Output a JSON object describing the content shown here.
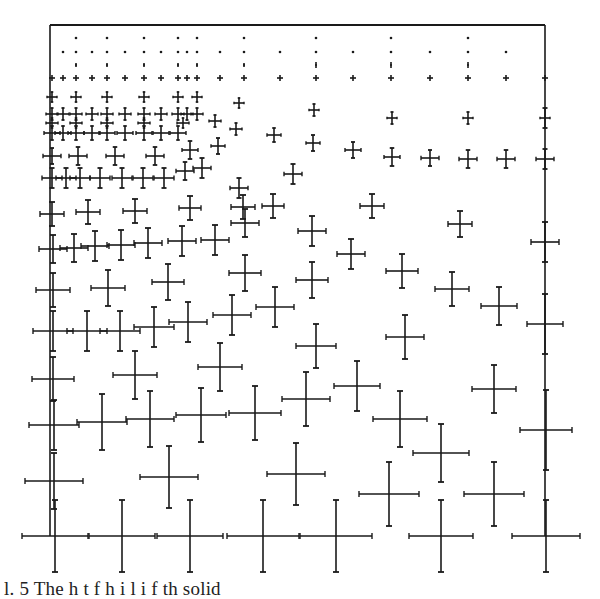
{
  "figure": {
    "frame": {
      "left": 50,
      "top": 25,
      "right": 545,
      "bottom": 536
    },
    "ink": "#1a1a1a",
    "caption": "l. 5   The   h    t             f       h       i    l    i    f  th   solid"
  },
  "chart_data": {
    "type": "scatter",
    "title": "",
    "xlabel": "",
    "ylabel": "",
    "grid": false,
    "legend": null,
    "points": [
      {
        "x": 76,
        "y": 38,
        "dx": 0,
        "dy": 0
      },
      {
        "x": 107,
        "y": 38,
        "dx": 0,
        "dy": 0
      },
      {
        "x": 144,
        "y": 38,
        "dx": 0,
        "dy": 0
      },
      {
        "x": 178,
        "y": 38,
        "dx": 0,
        "dy": 0
      },
      {
        "x": 197,
        "y": 38,
        "dx": 0,
        "dy": 0
      },
      {
        "x": 244,
        "y": 38,
        "dx": 0,
        "dy": 0
      },
      {
        "x": 316,
        "y": 38,
        "dx": 0,
        "dy": 0
      },
      {
        "x": 391,
        "y": 38,
        "dx": 0,
        "dy": 0
      },
      {
        "x": 468,
        "y": 38,
        "dx": 0,
        "dy": 0
      },
      {
        "x": 63,
        "y": 52,
        "dx": 0,
        "dy": 0
      },
      {
        "x": 76,
        "y": 52,
        "dx": 0,
        "dy": 0
      },
      {
        "x": 92,
        "y": 52,
        "dx": 0,
        "dy": 0
      },
      {
        "x": 107,
        "y": 52,
        "dx": 0,
        "dy": 0
      },
      {
        "x": 125,
        "y": 52,
        "dx": 0,
        "dy": 0
      },
      {
        "x": 144,
        "y": 52,
        "dx": 0,
        "dy": 0
      },
      {
        "x": 161,
        "y": 52,
        "dx": 0,
        "dy": 0
      },
      {
        "x": 178,
        "y": 52,
        "dx": 0,
        "dy": 0
      },
      {
        "x": 187,
        "y": 52,
        "dx": 0,
        "dy": 0
      },
      {
        "x": 197,
        "y": 52,
        "dx": 0,
        "dy": 0
      },
      {
        "x": 220,
        "y": 52,
        "dx": 0,
        "dy": 0
      },
      {
        "x": 244,
        "y": 52,
        "dx": 0,
        "dy": 0
      },
      {
        "x": 280,
        "y": 52,
        "dx": 0,
        "dy": 0
      },
      {
        "x": 316,
        "y": 52,
        "dx": 0,
        "dy": 0
      },
      {
        "x": 353,
        "y": 52,
        "dx": 0,
        "dy": 0
      },
      {
        "x": 391,
        "y": 52,
        "dx": 0,
        "dy": 0
      },
      {
        "x": 430,
        "y": 52,
        "dx": 0,
        "dy": 0
      },
      {
        "x": 468,
        "y": 52,
        "dx": 0,
        "dy": 0
      },
      {
        "x": 506,
        "y": 52,
        "dx": 0,
        "dy": 0
      },
      {
        "x": 76,
        "y": 65,
        "dx": 1,
        "dy": 2
      },
      {
        "x": 107,
        "y": 65,
        "dx": 1,
        "dy": 2
      },
      {
        "x": 144,
        "y": 65,
        "dx": 1,
        "dy": 2
      },
      {
        "x": 178,
        "y": 65,
        "dx": 1,
        "dy": 2
      },
      {
        "x": 197,
        "y": 65,
        "dx": 1,
        "dy": 2
      },
      {
        "x": 244,
        "y": 65,
        "dx": 1,
        "dy": 2
      },
      {
        "x": 316,
        "y": 65,
        "dx": 1,
        "dy": 3
      },
      {
        "x": 391,
        "y": 65,
        "dx": 1,
        "dy": 3
      },
      {
        "x": 468,
        "y": 65,
        "dx": 1,
        "dy": 3
      },
      {
        "x": 52,
        "y": 78,
        "dx": 3,
        "dy": 3
      },
      {
        "x": 63,
        "y": 78,
        "dx": 3,
        "dy": 3
      },
      {
        "x": 76,
        "y": 78,
        "dx": 3,
        "dy": 3
      },
      {
        "x": 92,
        "y": 78,
        "dx": 3,
        "dy": 3
      },
      {
        "x": 107,
        "y": 78,
        "dx": 3,
        "dy": 3
      },
      {
        "x": 125,
        "y": 78,
        "dx": 3,
        "dy": 3
      },
      {
        "x": 144,
        "y": 78,
        "dx": 3,
        "dy": 3
      },
      {
        "x": 161,
        "y": 78,
        "dx": 3,
        "dy": 3
      },
      {
        "x": 178,
        "y": 78,
        "dx": 3,
        "dy": 3
      },
      {
        "x": 187,
        "y": 78,
        "dx": 3,
        "dy": 3
      },
      {
        "x": 197,
        "y": 78,
        "dx": 3,
        "dy": 3
      },
      {
        "x": 220,
        "y": 78,
        "dx": 3,
        "dy": 3
      },
      {
        "x": 244,
        "y": 78,
        "dx": 3,
        "dy": 3
      },
      {
        "x": 280,
        "y": 78,
        "dx": 3,
        "dy": 3
      },
      {
        "x": 316,
        "y": 78,
        "dx": 3,
        "dy": 3
      },
      {
        "x": 353,
        "y": 78,
        "dx": 3,
        "dy": 3
      },
      {
        "x": 391,
        "y": 78,
        "dx": 3,
        "dy": 3
      },
      {
        "x": 430,
        "y": 78,
        "dx": 3,
        "dy": 3
      },
      {
        "x": 468,
        "y": 78,
        "dx": 3,
        "dy": 3
      },
      {
        "x": 506,
        "y": 78,
        "dx": 3,
        "dy": 3
      },
      {
        "x": 545,
        "y": 78,
        "dx": 3,
        "dy": 3
      },
      {
        "x": 52,
        "y": 97,
        "dx": 5,
        "dy": 5
      },
      {
        "x": 76,
        "y": 97,
        "dx": 5,
        "dy": 5
      },
      {
        "x": 107,
        "y": 97,
        "dx": 5,
        "dy": 5
      },
      {
        "x": 144,
        "y": 97,
        "dx": 5,
        "dy": 5
      },
      {
        "x": 178,
        "y": 97,
        "dx": 5,
        "dy": 5
      },
      {
        "x": 197,
        "y": 97,
        "dx": 5,
        "dy": 5
      },
      {
        "x": 239,
        "y": 103,
        "dx": 5,
        "dy": 5
      },
      {
        "x": 314,
        "y": 110,
        "dx": 5,
        "dy": 6
      },
      {
        "x": 392,
        "y": 118,
        "dx": 5,
        "dy": 6
      },
      {
        "x": 468,
        "y": 118,
        "dx": 5,
        "dy": 6
      },
      {
        "x": 545,
        "y": 118,
        "dx": 5,
        "dy": 10
      },
      {
        "x": 52,
        "y": 114,
        "dx": 6,
        "dy": 6
      },
      {
        "x": 63,
        "y": 114,
        "dx": 6,
        "dy": 6
      },
      {
        "x": 76,
        "y": 114,
        "dx": 6,
        "dy": 6
      },
      {
        "x": 92,
        "y": 114,
        "dx": 6,
        "dy": 6
      },
      {
        "x": 107,
        "y": 114,
        "dx": 6,
        "dy": 6
      },
      {
        "x": 125,
        "y": 114,
        "dx": 6,
        "dy": 6
      },
      {
        "x": 144,
        "y": 114,
        "dx": 6,
        "dy": 6
      },
      {
        "x": 161,
        "y": 114,
        "dx": 6,
        "dy": 6
      },
      {
        "x": 178,
        "y": 114,
        "dx": 6,
        "dy": 6
      },
      {
        "x": 187,
        "y": 114,
        "dx": 6,
        "dy": 6
      },
      {
        "x": 197,
        "y": 114,
        "dx": 6,
        "dy": 6
      },
      {
        "x": 52,
        "y": 123,
        "dx": 6,
        "dy": 5
      },
      {
        "x": 76,
        "y": 123,
        "dx": 6,
        "dy": 5
      },
      {
        "x": 107,
        "y": 123,
        "dx": 6,
        "dy": 5
      },
      {
        "x": 144,
        "y": 123,
        "dx": 6,
        "dy": 5
      },
      {
        "x": 183,
        "y": 123,
        "dx": 6,
        "dy": 5
      },
      {
        "x": 215,
        "y": 121,
        "dx": 6,
        "dy": 6
      },
      {
        "x": 52,
        "y": 133,
        "dx": 8,
        "dy": 7
      },
      {
        "x": 63,
        "y": 133,
        "dx": 8,
        "dy": 7
      },
      {
        "x": 76,
        "y": 133,
        "dx": 8,
        "dy": 7
      },
      {
        "x": 92,
        "y": 133,
        "dx": 8,
        "dy": 7
      },
      {
        "x": 107,
        "y": 133,
        "dx": 8,
        "dy": 7
      },
      {
        "x": 125,
        "y": 133,
        "dx": 8,
        "dy": 7
      },
      {
        "x": 144,
        "y": 133,
        "dx": 8,
        "dy": 7
      },
      {
        "x": 161,
        "y": 133,
        "dx": 8,
        "dy": 7
      },
      {
        "x": 178,
        "y": 133,
        "dx": 8,
        "dy": 7
      },
      {
        "x": 236,
        "y": 129,
        "dx": 6,
        "dy": 6
      },
      {
        "x": 274,
        "y": 135,
        "dx": 7,
        "dy": 7
      },
      {
        "x": 313,
        "y": 143,
        "dx": 7,
        "dy": 8
      },
      {
        "x": 353,
        "y": 150,
        "dx": 8,
        "dy": 8
      },
      {
        "x": 392,
        "y": 157,
        "dx": 8,
        "dy": 9
      },
      {
        "x": 430,
        "y": 158,
        "dx": 9,
        "dy": 8
      },
      {
        "x": 468,
        "y": 159,
        "dx": 9,
        "dy": 9
      },
      {
        "x": 506,
        "y": 159,
        "dx": 9,
        "dy": 9
      },
      {
        "x": 545,
        "y": 159,
        "dx": 9,
        "dy": 10
      },
      {
        "x": 52,
        "y": 156,
        "dx": 9,
        "dy": 8
      },
      {
        "x": 78,
        "y": 156,
        "dx": 9,
        "dy": 9
      },
      {
        "x": 115,
        "y": 156,
        "dx": 9,
        "dy": 9
      },
      {
        "x": 155,
        "y": 156,
        "dx": 9,
        "dy": 9
      },
      {
        "x": 190,
        "y": 150,
        "dx": 8,
        "dy": 9
      },
      {
        "x": 218,
        "y": 146,
        "dx": 7,
        "dy": 8
      },
      {
        "x": 52,
        "y": 178,
        "dx": 10,
        "dy": 10
      },
      {
        "x": 66,
        "y": 178,
        "dx": 10,
        "dy": 10
      },
      {
        "x": 80,
        "y": 178,
        "dx": 10,
        "dy": 10
      },
      {
        "x": 100,
        "y": 178,
        "dx": 10,
        "dy": 10
      },
      {
        "x": 122,
        "y": 178,
        "dx": 10,
        "dy": 10
      },
      {
        "x": 143,
        "y": 178,
        "dx": 10,
        "dy": 10
      },
      {
        "x": 164,
        "y": 178,
        "dx": 10,
        "dy": 10
      },
      {
        "x": 185,
        "y": 171,
        "dx": 9,
        "dy": 9
      },
      {
        "x": 202,
        "y": 168,
        "dx": 9,
        "dy": 10
      },
      {
        "x": 293,
        "y": 174,
        "dx": 9,
        "dy": 10
      },
      {
        "x": 239,
        "y": 188,
        "dx": 9,
        "dy": 10
      },
      {
        "x": 52,
        "y": 214,
        "dx": 12,
        "dy": 12
      },
      {
        "x": 88,
        "y": 212,
        "dx": 12,
        "dy": 12
      },
      {
        "x": 135,
        "y": 211,
        "dx": 12,
        "dy": 12
      },
      {
        "x": 190,
        "y": 208,
        "dx": 11,
        "dy": 12
      },
      {
        "x": 243,
        "y": 207,
        "dx": 12,
        "dy": 12
      },
      {
        "x": 273,
        "y": 206,
        "dx": 11,
        "dy": 12
      },
      {
        "x": 372,
        "y": 206,
        "dx": 12,
        "dy": 12
      },
      {
        "x": 460,
        "y": 224,
        "dx": 12,
        "dy": 13
      },
      {
        "x": 53,
        "y": 249,
        "dx": 14,
        "dy": 14
      },
      {
        "x": 74,
        "y": 248,
        "dx": 14,
        "dy": 14
      },
      {
        "x": 95,
        "y": 246,
        "dx": 14,
        "dy": 15
      },
      {
        "x": 121,
        "y": 245,
        "dx": 14,
        "dy": 15
      },
      {
        "x": 148,
        "y": 243,
        "dx": 14,
        "dy": 15
      },
      {
        "x": 182,
        "y": 241,
        "dx": 14,
        "dy": 15
      },
      {
        "x": 215,
        "y": 240,
        "dx": 14,
        "dy": 15
      },
      {
        "x": 245,
        "y": 223,
        "dx": 14,
        "dy": 14
      },
      {
        "x": 312,
        "y": 231,
        "dx": 14,
        "dy": 15
      },
      {
        "x": 351,
        "y": 254,
        "dx": 14,
        "dy": 15
      },
      {
        "x": 545,
        "y": 242,
        "dx": 14,
        "dy": 20
      },
      {
        "x": 53,
        "y": 290,
        "dx": 17,
        "dy": 17
      },
      {
        "x": 108,
        "y": 288,
        "dx": 17,
        "dy": 18
      },
      {
        "x": 168,
        "y": 282,
        "dx": 16,
        "dy": 18
      },
      {
        "x": 245,
        "y": 273,
        "dx": 16,
        "dy": 18
      },
      {
        "x": 312,
        "y": 280,
        "dx": 16,
        "dy": 18
      },
      {
        "x": 402,
        "y": 271,
        "dx": 16,
        "dy": 17
      },
      {
        "x": 452,
        "y": 289,
        "dx": 17,
        "dy": 17
      },
      {
        "x": 499,
        "y": 306,
        "dx": 18,
        "dy": 19
      },
      {
        "x": 53,
        "y": 331,
        "dx": 20,
        "dy": 20
      },
      {
        "x": 87,
        "y": 331,
        "dx": 20,
        "dy": 20
      },
      {
        "x": 120,
        "y": 331,
        "dx": 20,
        "dy": 20
      },
      {
        "x": 154,
        "y": 327,
        "dx": 20,
        "dy": 20
      },
      {
        "x": 188,
        "y": 322,
        "dx": 19,
        "dy": 20
      },
      {
        "x": 232,
        "y": 315,
        "dx": 19,
        "dy": 20
      },
      {
        "x": 275,
        "y": 307,
        "dx": 19,
        "dy": 20
      },
      {
        "x": 316,
        "y": 346,
        "dx": 20,
        "dy": 22
      },
      {
        "x": 405,
        "y": 337,
        "dx": 19,
        "dy": 22
      },
      {
        "x": 545,
        "y": 324,
        "dx": 18,
        "dy": 30
      },
      {
        "x": 53,
        "y": 379,
        "dx": 21,
        "dy": 22
      },
      {
        "x": 135,
        "y": 375,
        "dx": 22,
        "dy": 24
      },
      {
        "x": 220,
        "y": 367,
        "dx": 22,
        "dy": 24
      },
      {
        "x": 357,
        "y": 386,
        "dx": 23,
        "dy": 25
      },
      {
        "x": 494,
        "y": 389,
        "dx": 22,
        "dy": 24
      },
      {
        "x": 54,
        "y": 425,
        "dx": 25,
        "dy": 25
      },
      {
        "x": 102,
        "y": 422,
        "dx": 25,
        "dy": 28
      },
      {
        "x": 150,
        "y": 419,
        "dx": 24,
        "dy": 28
      },
      {
        "x": 201,
        "y": 415,
        "dx": 25,
        "dy": 27
      },
      {
        "x": 255,
        "y": 413,
        "dx": 26,
        "dy": 27
      },
      {
        "x": 306,
        "y": 399,
        "dx": 24,
        "dy": 27
      },
      {
        "x": 400,
        "y": 419,
        "dx": 27,
        "dy": 28
      },
      {
        "x": 546,
        "y": 430,
        "dx": 26,
        "dy": 40
      },
      {
        "x": 54,
        "y": 481,
        "dx": 29,
        "dy": 28
      },
      {
        "x": 169,
        "y": 477,
        "dx": 29,
        "dy": 31
      },
      {
        "x": 296,
        "y": 474,
        "dx": 29,
        "dy": 31
      },
      {
        "x": 441,
        "y": 453,
        "dx": 28,
        "dy": 29
      },
      {
        "x": 389,
        "y": 494,
        "dx": 30,
        "dy": 32
      },
      {
        "x": 494,
        "y": 494,
        "dx": 30,
        "dy": 32
      },
      {
        "x": 55,
        "y": 536,
        "dx": 33,
        "dy": 36
      },
      {
        "x": 122,
        "y": 536,
        "dx": 33,
        "dy": 36
      },
      {
        "x": 190,
        "y": 536,
        "dx": 33,
        "dy": 36
      },
      {
        "x": 263,
        "y": 536,
        "dx": 36,
        "dy": 36
      },
      {
        "x": 336,
        "y": 536,
        "dx": 36,
        "dy": 36
      },
      {
        "x": 441,
        "y": 536,
        "dx": 32,
        "dy": 36
      },
      {
        "x": 546,
        "y": 536,
        "dx": 34,
        "dy": 36
      }
    ]
  }
}
